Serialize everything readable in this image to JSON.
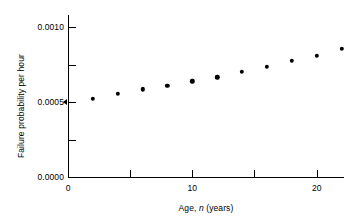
{
  "chart_data": {
    "type": "scatter",
    "title": "",
    "xlabel": "Age, n (years)",
    "xlabel_parts": {
      "pre": "Age, ",
      "italic": "n",
      "post": " (years)"
    },
    "ylabel": "Failure probability per hour",
    "xlim": [
      0,
      22.2
    ],
    "ylim": [
      0.0,
      0.00108
    ],
    "grid": false,
    "legend": null,
    "x_ticks": [
      {
        "value": 0,
        "label": "0",
        "major": true
      },
      {
        "value": 5,
        "label": "",
        "major": false
      },
      {
        "value": 10,
        "label": "10",
        "major": true
      },
      {
        "value": 15,
        "label": "",
        "major": false
      },
      {
        "value": 20,
        "label": "20",
        "major": true
      }
    ],
    "y_ticks": [
      {
        "value": 0.0,
        "label": "0.0000",
        "major": true
      },
      {
        "value": 0.00025,
        "label": "",
        "major": false
      },
      {
        "value": 0.0005,
        "label": "0.0005",
        "major": true
      },
      {
        "value": 0.00075,
        "label": "",
        "major": false
      },
      {
        "value": 0.001,
        "label": "0.0010",
        "major": true
      }
    ],
    "y_axis_marker": {
      "value": 0.0005,
      "style": "arrow"
    },
    "x": [
      2,
      4,
      6,
      8,
      10,
      12,
      14,
      16,
      18,
      20,
      22
    ],
    "values": [
      0.00052,
      0.000555,
      0.000585,
      0.00061,
      0.000638,
      0.000665,
      0.0007,
      0.000735,
      0.000775,
      0.00081,
      0.000855
    ],
    "marker": {
      "shape": "circle",
      "color": "#000000",
      "size": 4.4
    },
    "colors": {
      "axis": "#000000",
      "marker": "#000000",
      "background": "#ffffff"
    }
  }
}
